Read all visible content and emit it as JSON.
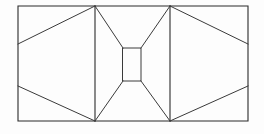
{
  "figure": {
    "canvas": {
      "width": 264,
      "height": 134,
      "background": "#fdfdfd"
    },
    "style": {
      "stroke_color": "#2b2b2b",
      "stroke_color_secondary": "#3a3a3a",
      "stroke_width": 1.1,
      "fill": "none"
    },
    "chart_data": {
      "type": "diagram",
      "title": "Geometric line drawing",
      "xlabel": "",
      "ylabel": "",
      "xlim": [
        0,
        264
      ],
      "ylim": [
        0,
        134
      ],
      "grid": false,
      "legend": "none",
      "points": {
        "outer_top_left": [
          18,
          6
        ],
        "outer_top_right": [
          248,
          6
        ],
        "outer_bottom_right": [
          248,
          121
        ],
        "outer_bottom_left": [
          18,
          121
        ],
        "left_vertical_top": [
          95,
          6
        ],
        "left_vertical_bottom": [
          95,
          121
        ],
        "right_vertical_top": [
          170,
          6
        ],
        "right_vertical_bottom": [
          170,
          121
        ],
        "square_top_left": [
          123,
          48
        ],
        "square_top_right": [
          141,
          48
        ],
        "square_bottom_right": [
          141,
          81
        ],
        "square_bottom_left": [
          123,
          81
        ],
        "left_edge_upper_node": [
          18,
          44
        ],
        "left_edge_lower_node": [
          18,
          86
        ],
        "right_edge_upper_node": [
          248,
          44
        ],
        "right_edge_lower_node": [
          248,
          86
        ]
      },
      "shapes": [
        {
          "name": "outer-rectangle",
          "kind": "rect",
          "x": 18,
          "y": 6,
          "width": 230,
          "height": 115
        },
        {
          "name": "center-square",
          "kind": "rect",
          "x": 123,
          "y": 48,
          "width": 18,
          "height": 33
        }
      ],
      "segments": [
        {
          "name": "left-vertical-divider",
          "x1": 95,
          "y1": 6,
          "x2": 95,
          "y2": 121
        },
        {
          "name": "right-vertical-divider",
          "x1": 170,
          "y1": 6,
          "x2": 170,
          "y2": 121
        },
        {
          "name": "left-upper-diagonal",
          "x1": 18,
          "y1": 44,
          "x2": 95,
          "y2": 6
        },
        {
          "name": "left-lower-diagonal",
          "x1": 18,
          "y1": 86,
          "x2": 95,
          "y2": 121
        },
        {
          "name": "right-upper-diagonal",
          "x1": 248,
          "y1": 44,
          "x2": 170,
          "y2": 6
        },
        {
          "name": "right-lower-diagonal",
          "x1": 248,
          "y1": 86,
          "x2": 170,
          "y2": 121
        },
        {
          "name": "inner-upper-left-diagonal",
          "x1": 95,
          "y1": 6,
          "x2": 123,
          "y2": 48
        },
        {
          "name": "inner-lower-left-diagonal",
          "x1": 95,
          "y1": 121,
          "x2": 123,
          "y2": 81
        },
        {
          "name": "inner-upper-right-diagonal",
          "x1": 170,
          "y1": 6,
          "x2": 141,
          "y2": 48
        },
        {
          "name": "inner-lower-right-diagonal",
          "x1": 170,
          "y1": 121,
          "x2": 141,
          "y2": 81
        }
      ]
    }
  }
}
